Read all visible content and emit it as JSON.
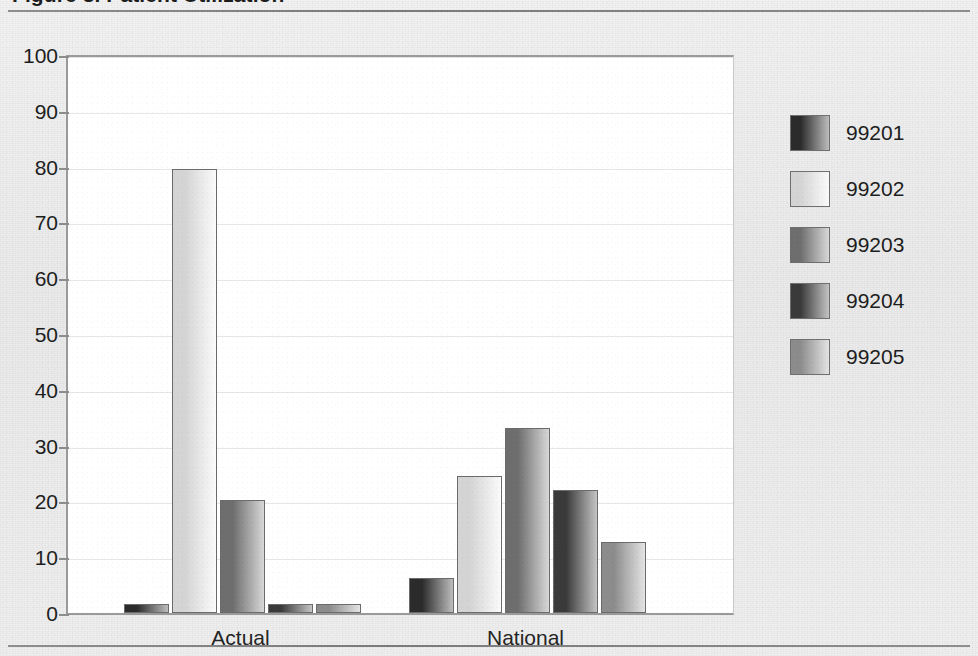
{
  "figure": {
    "caption": "Figure 3.  Patient Utilization",
    "caption_cropped": true
  },
  "chart_data": {
    "type": "bar",
    "title": "Patient Utilization",
    "xlabel": "",
    "ylabel": "",
    "categories": [
      "Actual",
      "National"
    ],
    "ylim": [
      0,
      100
    ],
    "yticks": [
      0,
      10,
      20,
      30,
      40,
      50,
      60,
      70,
      80,
      90,
      100
    ],
    "ytick_labels": [
      "0",
      "10",
      "20",
      "30",
      "40",
      "50",
      "60",
      "70",
      "80",
      "90",
      "100"
    ],
    "grid": true,
    "grid_axis": "y",
    "legend_position": "right",
    "series": [
      {
        "name": "99201",
        "values": [
          1.7,
          6.2
        ],
        "color": "#2b2b2b",
        "color_light": "#bdbdbd"
      },
      {
        "name": "99202",
        "values": [
          79.5,
          24.6
        ],
        "color": "#d4d4d4",
        "color_light": "#fbfbfb"
      },
      {
        "name": "99203",
        "values": [
          20.3,
          33.2
        ],
        "color": "#6e6e6e",
        "color_light": "#d8d8d8"
      },
      {
        "name": "99204",
        "values": [
          1.7,
          22.1
        ],
        "color": "#3a3a3a",
        "color_light": "#c4c4c4"
      },
      {
        "name": "99205",
        "values": [
          1.7,
          12.7
        ],
        "color": "#8c8c8c",
        "color_light": "#e4e4e4"
      }
    ]
  },
  "legend": {
    "entries": [
      {
        "label": "99201"
      },
      {
        "label": "99202"
      },
      {
        "label": "99203"
      },
      {
        "label": "99204"
      },
      {
        "label": "99205"
      }
    ]
  },
  "axis": {
    "x_labels": [
      "Actual",
      "National"
    ]
  }
}
